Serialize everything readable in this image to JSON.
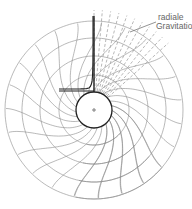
{
  "diagram": {
    "title": "",
    "center": {
      "x": 94,
      "y": 110
    },
    "inner_circle_radius": 18,
    "ring_radii": [
      35,
      54,
      72,
      89
    ],
    "grid_start_angle_deg": 40,
    "grid_end_angle_deg": 450,
    "left_grid_end_angle_deg": 103,
    "spoke_count": 28,
    "spiral_twist": 0.9,
    "colors": {
      "grid": "#8a8a8a",
      "bold": "#222222",
      "dashed": "#9a9a9a",
      "label": "#666666"
    },
    "dashed_rays": {
      "count": 11,
      "from_angle_deg": 90,
      "to_angle_deg": 42,
      "length": 100
    },
    "vertical_line": {
      "x": 94,
      "y1": 16,
      "y2": 92
    },
    "horizontal_line": {
      "x1": 59,
      "x2": 94,
      "y": 91
    },
    "annotation": {
      "line1": "radiale",
      "line2": "Gravitation",
      "arrow_from": {
        "x": 156,
        "y": 22
      },
      "arrow_to": {
        "x": 130,
        "y": 32
      }
    }
  }
}
